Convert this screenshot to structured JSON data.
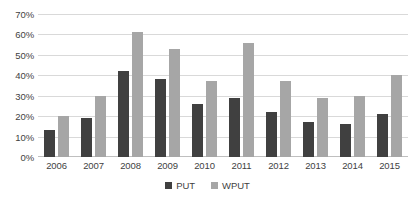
{
  "chart_data": {
    "type": "bar",
    "title": "",
    "xlabel": "",
    "ylabel": "",
    "categories": [
      "2006",
      "2007",
      "2008",
      "2009",
      "2010",
      "2011",
      "2012",
      "2013",
      "2014",
      "2015"
    ],
    "series": [
      {
        "name": "PUT",
        "color": "#404040",
        "values": [
          13,
          19,
          42,
          38,
          26,
          29,
          22,
          17,
          16,
          21
        ]
      },
      {
        "name": "WPUT",
        "color": "#a6a6a6",
        "values": [
          20,
          30,
          61,
          53,
          37,
          56,
          37,
          29,
          30,
          40
        ]
      }
    ],
    "ylim": [
      0,
      70
    ],
    "ytick_step": 10,
    "ytick_labels": [
      "0%",
      "10%",
      "20%",
      "30%",
      "40%",
      "50%",
      "60%",
      "70%"
    ],
    "ytick_values": [
      0,
      10,
      20,
      30,
      40,
      50,
      60,
      70
    ],
    "grid": true,
    "legend_position": "bottom",
    "value_suffix": "%"
  },
  "colors": {
    "background": "#ffffff",
    "gridline": "#d9d9d9",
    "axis": "#bfbfbf",
    "text": "#3f3f3f"
  }
}
